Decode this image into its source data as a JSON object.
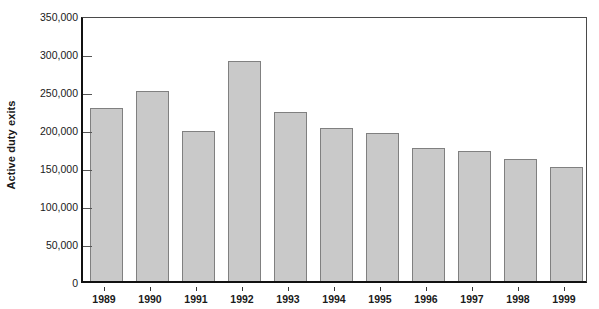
{
  "chart_data": {
    "type": "bar",
    "title": "",
    "subtitle": "",
    "xlabel": "",
    "ylabel": "Active duty exits",
    "categories": [
      "1989",
      "1990",
      "1991",
      "1992",
      "1993",
      "1994",
      "1995",
      "1996",
      "1997",
      "1998",
      "1999"
    ],
    "values": [
      227000,
      250000,
      198000,
      290000,
      222000,
      201000,
      195000,
      175000,
      171000,
      161000,
      150000
    ],
    "ylim": [
      0,
      350000
    ],
    "ytick_values": [
      0,
      50000,
      100000,
      150000,
      200000,
      250000,
      300000,
      350000
    ],
    "ytick_labels": [
      "0",
      "50,000",
      "100,000",
      "150,000",
      "200,000",
      "250,000",
      "300,000",
      "350,000"
    ],
    "grid": false,
    "legend": null,
    "legend_position": "none",
    "bar_fill_color": "#c9c9c9",
    "bar_border_color": "#808080",
    "axis_color": "#111111",
    "background_color": "#ffffff"
  }
}
